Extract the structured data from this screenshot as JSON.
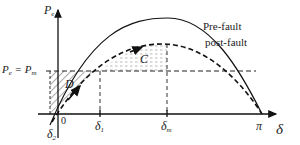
{
  "diagram": {
    "y_axis": {
      "label": "P",
      "label_sub": "e"
    },
    "x_axis": {
      "label": "δ"
    },
    "level_line": {
      "label_left": "P",
      "label_left_sub": "e",
      "label_eq": " = P",
      "label_right_sub": "m"
    },
    "curves": [
      {
        "name": "Pre-fault",
        "style": "solid"
      },
      {
        "name": "post-fault",
        "style": "dashed"
      }
    ],
    "areas": [
      {
        "name": "D",
        "fill": "hatched"
      },
      {
        "name": "C",
        "fill": "dotted"
      }
    ],
    "ticks": {
      "origin": "0",
      "delta2": {
        "label": "δ",
        "sub": "2"
      },
      "delta1": {
        "label": "δ",
        "sub": "1"
      },
      "deltam": {
        "label": "δ",
        "sub": "m"
      },
      "pi": "π"
    },
    "colors": {
      "line": "#111111",
      "hatch": "#555555",
      "dots": "#888888",
      "background": "#ffffff"
    }
  }
}
